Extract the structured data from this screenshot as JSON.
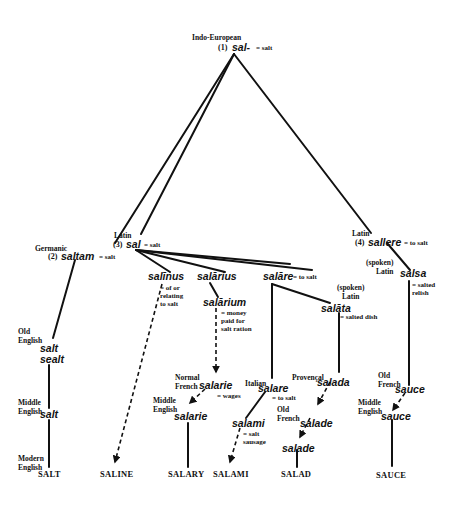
{
  "root": {
    "stage": "Indo-European",
    "number": "(1)",
    "word": "sal-",
    "gloss": "= salt"
  },
  "germanic": {
    "stage": "Germanic",
    "number": "(2)",
    "word": "saltam",
    "gloss": "= salt"
  },
  "latin": {
    "stage": "Latin",
    "number": "(3)",
    "word": "sal",
    "gloss": "= salt"
  },
  "latin4": {
    "stage": "Latin",
    "number": "(4)",
    "word": "sallere",
    "gloss": "= to salt"
  },
  "salinus": {
    "word": "salīnus",
    "gloss": "= of or\nrelating\nto salt"
  },
  "salarius": {
    "word": "salārius"
  },
  "salarium": {
    "word": "salārium",
    "gloss": "= money\npaid for\nsalt ration"
  },
  "salare": {
    "word": "salāre",
    "gloss": "= to salt"
  },
  "salata": {
    "stage": "(spoken)\nLatin",
    "word": "salāta",
    "gloss": "= salted dish"
  },
  "salsa": {
    "stage": "(spoken)\nLatin",
    "word": "salsa",
    "gloss": "= salted\nrelish"
  },
  "old_english": {
    "stage": "Old\nEnglish",
    "words": [
      "salt",
      "sealt"
    ]
  },
  "middle_english_salt": {
    "stage": "Middle\nEnglish",
    "word": "salt"
  },
  "modern_english": {
    "stage": "Modern\nEnglish"
  },
  "norman_french": {
    "stage": "Normal\nFrench",
    "word": "salarie",
    "gloss": "= wages"
  },
  "middle_english_salarie": {
    "stage": "Middle\nEnglish",
    "word": "salarie"
  },
  "italian": {
    "stage": "Italian",
    "word": "salare",
    "gloss": "= to salt"
  },
  "salami": {
    "word": "salami",
    "gloss": "= salt\nsausage"
  },
  "provencal": {
    "stage": "Provençal",
    "word": "salada"
  },
  "old_french_salade": {
    "stage": "Old\nFrench",
    "word": "salade"
  },
  "salade2": {
    "word": "salade"
  },
  "old_french_sauce": {
    "stage": "Old\nFrench",
    "word": "sauce"
  },
  "middle_english_sauce": {
    "stage": "Middle\nEnglish",
    "word": "sauce"
  },
  "finals": [
    "SALT",
    "SALINE",
    "SALARY",
    "SALAMI",
    "SALAD",
    "SAUCE"
  ]
}
